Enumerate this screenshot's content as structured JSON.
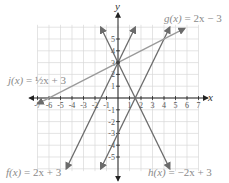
{
  "chart_data": {
    "type": "line",
    "title": "",
    "xlabel": "x",
    "ylabel": "y",
    "xlim": [
      -7,
      7
    ],
    "ylim": [
      -6,
      6
    ],
    "grid": true,
    "x_ticks": [
      -7,
      -6,
      -5,
      -4,
      -3,
      -2,
      -1,
      1,
      2,
      3,
      4,
      5,
      6,
      7
    ],
    "y_ticks": [
      -5,
      -4,
      -3,
      -2,
      -1,
      1,
      2,
      3,
      4,
      5
    ],
    "series": [
      {
        "name": "f(x) = 2x + 3",
        "slope": 2,
        "intercept": 3,
        "x_range": [
          -4.5,
          1.5
        ],
        "color": "#6b6b6b"
      },
      {
        "name": "g(x) = 2x − 3",
        "slope": 2,
        "intercept": -3,
        "x_range": [
          -1.5,
          4.5
        ],
        "color": "#6b6b6b"
      },
      {
        "name": "h(x) = −2x + 3",
        "slope": -2,
        "intercept": 3,
        "x_range": [
          -1.5,
          4.5
        ],
        "color": "#6b6b6b"
      },
      {
        "name": "j(x) = ½x + 3",
        "slope": 0.5,
        "intercept": 3,
        "x_range": [
          -7,
          5.8
        ],
        "color": "#9a9a9a"
      }
    ]
  },
  "labels": {
    "x_axis": "x",
    "y_axis": "y",
    "f": {
      "name": "f(x)",
      "rhs": " = 2x + 3"
    },
    "g": {
      "name": "g(x)",
      "rhs": " = 2x − 3"
    },
    "h": {
      "name": "h(x)",
      "rhs": " = −2x + 3"
    },
    "j": {
      "name": "j(x)",
      "rhs": " = ½x + 3"
    }
  },
  "colors": {
    "grid": "#d8d8d8",
    "axis": "#222222",
    "line": "#6b6b6b",
    "label": "#8a8a8a"
  }
}
